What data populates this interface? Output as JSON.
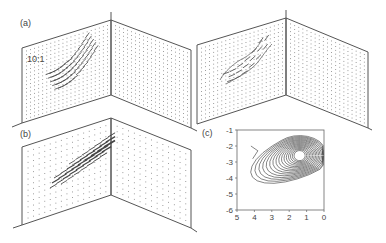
{
  "figure": {
    "panel_a_label": "(a)",
    "panel_b_label": "(b)",
    "panel_c_label": "(c)",
    "scale_label": "10:1"
  },
  "colors": {
    "line": "#555555",
    "dots": "#888888",
    "arrows": "#444444",
    "contours": "#333333"
  },
  "chart_data": {
    "type": "contour",
    "title": "",
    "xlabel": "",
    "ylabel": "",
    "xlim": [
      5,
      0
    ],
    "ylim": [
      -6,
      -1
    ],
    "x_ticks": [
      "5",
      "4",
      "3",
      "2",
      "1",
      "0"
    ],
    "y_ticks": [
      "-1",
      "-2",
      "-3",
      "-4",
      "-5",
      "-6"
    ],
    "peak": {
      "x": 1.4,
      "y": -2.6
    },
    "contour_levels": 16,
    "grid": false
  }
}
